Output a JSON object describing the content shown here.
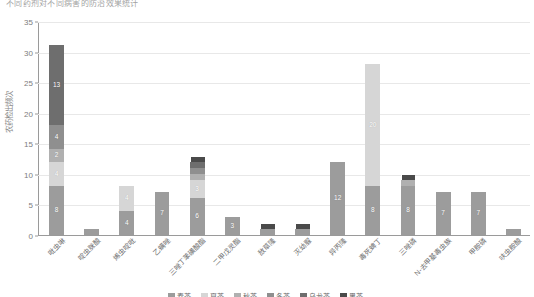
{
  "chart_data": {
    "type": "bar",
    "subtype": "stacked-column",
    "title": "不同药剂对不同病害的防治效果统计",
    "xlabel": "",
    "ylabel": "农药检出频次",
    "ylim": [
      0,
      35
    ],
    "ytick_step": 5,
    "yticks": [
      "0",
      "5",
      "10",
      "15",
      "20",
      "25",
      "30",
      "35"
    ],
    "grid": true,
    "grid_axis": "y",
    "legend_position": "bottom",
    "categories": [
      "吡虫啉",
      "啶虫脒酸",
      "烯虫啶吡",
      "乙螨唑",
      "三唑丁苯磺酸酯",
      "二甲戊灵酯",
      "敌草隆",
      "灭幼脲",
      "异丙隆",
      "毒死蜱丁",
      "三唑磷",
      "N-去甲基毒虫族",
      "甲胺磷",
      "呋虫胺酸"
    ],
    "series": [
      {
        "name": "春茶",
        "color": "#9c9c9c",
        "values": [
          8,
          1,
          4,
          7,
          6,
          3,
          1,
          1,
          12,
          8,
          8,
          7,
          7,
          1
        ]
      },
      {
        "name": "夏茶",
        "color": "#d6d6d6",
        "values": [
          4,
          0,
          4,
          0,
          3,
          0,
          0,
          0,
          0,
          20,
          0,
          0,
          0,
          0
        ]
      },
      {
        "name": "秋茶",
        "color": "#b0b0b0",
        "values": [
          2,
          0,
          0,
          0,
          1,
          0,
          0,
          0,
          0,
          0,
          1,
          0,
          0,
          0
        ]
      },
      {
        "name": "冬茶",
        "color": "#8f8f8f",
        "values": [
          4,
          0,
          0,
          0,
          1,
          0,
          0,
          0,
          0,
          0,
          0,
          0,
          0,
          0
        ]
      },
      {
        "name": "乌龙茶",
        "color": "#6e6e6e",
        "values": [
          13,
          0,
          0,
          0,
          1,
          0,
          0,
          0,
          0,
          0,
          0,
          0,
          0,
          0
        ]
      },
      {
        "name": "黑茶",
        "color": "#4a4a4a",
        "values": [
          0,
          0,
          0,
          0,
          0,
          0,
          0,
          0,
          0,
          0,
          0,
          0,
          0,
          0
        ]
      }
    ],
    "totals": [
      31,
      1,
      8,
      7,
      12,
      3,
      1,
      1,
      12,
      28,
      9,
      7,
      7,
      1
    ],
    "bar_labels": [
      [
        {
          "text": "8",
          "series": 0
        },
        {
          "text": "4",
          "series": 1
        },
        {
          "text": "2",
          "series": 2
        },
        {
          "text": "4",
          "series": 3
        },
        {
          "text": "13",
          "series": 4
        }
      ],
      [],
      [
        {
          "text": "4",
          "series": 0
        },
        {
          "text": "4",
          "series": 1
        }
      ],
      [
        {
          "text": "7",
          "series": 0
        }
      ],
      [
        {
          "text": "6",
          "series": 0
        },
        {
          "text": "3",
          "series": 1
        }
      ],
      [
        {
          "text": "3",
          "series": 0
        }
      ],
      [],
      [],
      [
        {
          "text": "12",
          "series": 0
        }
      ],
      [
        {
          "text": "8",
          "series": 0
        },
        {
          "text": "20",
          "series": 1
        }
      ],
      [
        {
          "text": "8",
          "series": 0
        }
      ],
      [
        {
          "text": "7",
          "series": 0
        }
      ],
      [
        {
          "text": "7",
          "series": 0
        }
      ],
      []
    ]
  },
  "colors": {
    "background": "#ffffff",
    "axis": "#9a9a9a",
    "grid": "#e8e8e8",
    "tick_text": "#7d7d7d",
    "label_text": "#6f6f6f"
  }
}
